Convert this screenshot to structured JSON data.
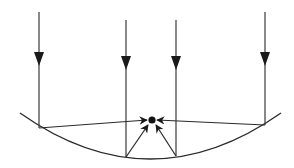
{
  "diagram": {
    "title": "Parallel rays reflecting off a concave (spherical) mirror to a focal point",
    "colors": {
      "line": "#2a2a2a",
      "background": "#ffffff"
    },
    "incident_rays": [
      {
        "id": "ray-1",
        "x": 39,
        "y_start": 12,
        "y_end": 128
      },
      {
        "id": "ray-2",
        "x": 126,
        "y_start": 20,
        "y_end": 157
      },
      {
        "id": "ray-3",
        "x": 176,
        "y_start": 20,
        "y_end": 156
      },
      {
        "id": "ray-4",
        "x": 265,
        "y_start": 12,
        "y_end": 125
      }
    ],
    "mirror": {
      "type": "concave-arc",
      "start": [
        20,
        113
      ],
      "end": [
        281,
        113
      ],
      "lowest_y": 159
    },
    "focal_point": {
      "x": 152,
      "y": 120,
      "label": ""
    }
  }
}
